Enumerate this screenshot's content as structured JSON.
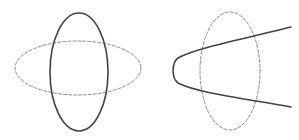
{
  "figure": {
    "width": 299,
    "height": 140,
    "background_color": "#ffffff",
    "panels": [
      {
        "name": "left-panel",
        "label": "vertical ellipse crossing horizontal ellipse",
        "shapes": [
          {
            "name": "horizontal-dashed-ellipse",
            "type": "ellipse",
            "style": "dashed",
            "stroke_color": "#8c8c8c",
            "stroke_width": 1,
            "dash_pattern": "3 2",
            "cx": 78,
            "cy": 68,
            "rx": 63,
            "ry": 27,
            "rotation": 0
          },
          {
            "name": "vertical-solid-ellipse",
            "type": "ellipse",
            "style": "solid",
            "stroke_color": "#434343",
            "stroke_width": 1.6,
            "dash_pattern": "none",
            "cx": 79,
            "cy": 72,
            "rx": 29,
            "ry": 59,
            "rotation": 0
          }
        ]
      },
      {
        "name": "right-panel",
        "label": "parabola crossing vertical ellipse",
        "shapes": [
          {
            "name": "vertical-dashed-ellipse",
            "type": "ellipse",
            "style": "dashed",
            "stroke_color": "#8c8c8c",
            "stroke_width": 1,
            "dash_pattern": "3 2",
            "cx": 230,
            "cy": 71,
            "rx": 30,
            "ry": 59,
            "rotation": 0
          },
          {
            "name": "solid-parabola",
            "type": "parabola",
            "style": "solid",
            "stroke_color": "#434343",
            "stroke_width": 1.6,
            "dash_pattern": "none",
            "vertex_x": 173,
            "vertex_y": 70,
            "opens": "right",
            "upper_end_x": 291,
            "upper_end_y": 27,
            "lower_end_x": 291,
            "lower_end_y": 107,
            "path": "M 291 27 C 247 38 196 48 178 58 C 172 62 171 78 178 83 C 197 93 248 99 291 107"
          }
        ]
      }
    ]
  }
}
